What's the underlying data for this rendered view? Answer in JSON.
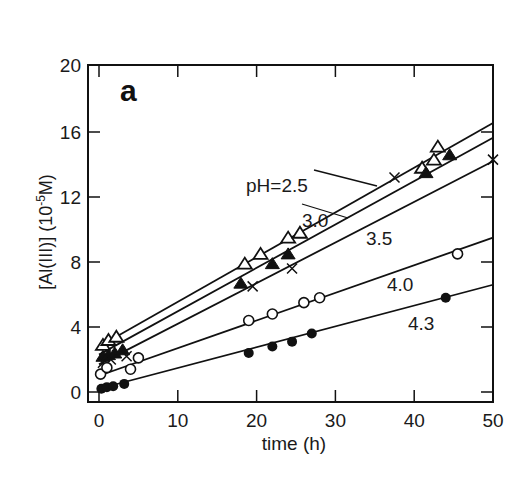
{
  "chart_data": {
    "type": "scatter",
    "panel_label": "a",
    "title": "",
    "xlabel": "time (h)",
    "ylabel": "[Al(III)]  (10-5M)",
    "ylabel_parts": {
      "main": "[Al(III)]  (10",
      "sup": "-5",
      "end": "M)"
    },
    "xlim": [
      0,
      50
    ],
    "ylim": [
      0,
      20
    ],
    "x_ticks": [
      0,
      10,
      20,
      30,
      40,
      50
    ],
    "y_ticks": [
      0,
      4,
      8,
      12,
      16,
      20
    ],
    "grid": false,
    "legend": "inline labels",
    "series": [
      {
        "name": "pH=2.5",
        "label": "pH=2.5",
        "marker": "triangle-open",
        "fit": {
          "intercept": 2.8,
          "slope": 0.275
        },
        "points": [
          [
            0.5,
            2.9
          ],
          [
            1.2,
            3.2
          ],
          [
            2.2,
            3.4
          ],
          [
            18.5,
            7.9
          ],
          [
            20.5,
            8.5
          ],
          [
            24,
            9.5
          ],
          [
            25.5,
            9.8
          ],
          [
            41,
            13.8
          ],
          [
            42.5,
            14.3
          ],
          [
            43,
            15.1
          ]
        ]
      },
      {
        "name": "pH=3.0",
        "label": "3.0",
        "marker": "triangle-filled",
        "fit": {
          "intercept": 2.3,
          "slope": 0.267
        },
        "points": [
          [
            0.5,
            2.2
          ],
          [
            1.2,
            2.3
          ],
          [
            2,
            2.4
          ],
          [
            3,
            2.6
          ],
          [
            18,
            6.7
          ],
          [
            22,
            7.9
          ],
          [
            24,
            8.5
          ],
          [
            41.5,
            13.5
          ],
          [
            44.5,
            14.6
          ]
        ]
      },
      {
        "name": "pH=3.5",
        "label": "3.5",
        "marker": "cross",
        "fit": {
          "intercept": 1.7,
          "slope": 0.25
        },
        "points": [
          [
            0.5,
            1.8
          ],
          [
            1.5,
            2.0
          ],
          [
            3.5,
            2.2
          ],
          [
            19.5,
            6.5
          ],
          [
            24.5,
            7.6
          ],
          [
            37.5,
            13.2
          ],
          [
            50,
            14.3
          ]
        ]
      },
      {
        "name": "pH=4.0",
        "label": "4.0",
        "marker": "circle-open",
        "fit": {
          "intercept": 1.0,
          "slope": 0.17
        },
        "points": [
          [
            0.2,
            1.1
          ],
          [
            1,
            1.5
          ],
          [
            4,
            1.4
          ],
          [
            5,
            2.1
          ],
          [
            19,
            4.4
          ],
          [
            22,
            4.8
          ],
          [
            26,
            5.5
          ],
          [
            28,
            5.8
          ],
          [
            45.5,
            8.5
          ]
        ]
      },
      {
        "name": "pH=4.3",
        "label": "4.3",
        "marker": "circle-filled",
        "fit": {
          "intercept": 0.2,
          "slope": 0.128
        },
        "points": [
          [
            0.3,
            0.2
          ],
          [
            1,
            0.3
          ],
          [
            1.8,
            0.35
          ],
          [
            3.2,
            0.5
          ],
          [
            19,
            2.4
          ],
          [
            22,
            2.8
          ],
          [
            24.5,
            3.1
          ],
          [
            27,
            3.6
          ],
          [
            44,
            5.8
          ]
        ]
      }
    ],
    "annotations": [
      {
        "text": "pH=2.5",
        "x_px": 246,
        "y_px": 192,
        "leader": [
          [
            314,
            170
          ],
          [
            377,
            186
          ]
        ]
      },
      {
        "text": "3.0",
        "x_px": 302,
        "y_px": 227,
        "leader": [
          [
            302,
            204
          ],
          [
            348,
            218
          ]
        ]
      },
      {
        "text": "3.5",
        "x_px": 366,
        "y_px": 245,
        "leader": null
      },
      {
        "text": "4.0",
        "x_px": 387,
        "y_px": 291,
        "leader": null
      },
      {
        "text": "4.3",
        "x_px": 408,
        "y_px": 330,
        "leader": null
      }
    ]
  },
  "layout": {
    "plot": {
      "left": 88,
      "top": 65,
      "right": 493,
      "bottom": 402
    },
    "x0_px": 99,
    "x_per_unit": 7.88,
    "y0_px": 392,
    "y_per_unit": 16.25,
    "ink": "#111111"
  }
}
